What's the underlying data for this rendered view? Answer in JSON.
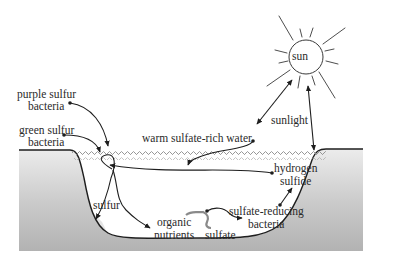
{
  "diagram": {
    "type": "ecosystem-cycle",
    "colors": {
      "line": "#1e1e1e",
      "ground_light": "#e9e9e9",
      "ground_dark": "#b4b4b4",
      "water_waves": "#8c8c8c",
      "background": "#ffffff"
    },
    "labels": {
      "sun": "sun",
      "sunlight": "sunlight",
      "warm_water": "warm sulfate-rich water",
      "purple_sulfur_line1": "purple sulfur",
      "purple_sulfur_line2": "bacteria",
      "green_sulfur_line1": "green sulfur",
      "green_sulfur_line2": "bacteria",
      "hydrogen_sulfide_line1": "hydrogen",
      "hydrogen_sulfide_line2": "sulfide",
      "sulfur": "sulfur",
      "organic_nutrients_line1": "organic",
      "organic_nutrients_line2": "nutrients",
      "sulfate": "sulfate",
      "sulfate_reducing_line1": "sulfate-reducing",
      "sulfate_reducing_line2": "bacteria"
    },
    "nodes": [
      {
        "id": "sun",
        "label": "sun"
      },
      {
        "id": "sunlight",
        "label": "sunlight"
      },
      {
        "id": "warm_water",
        "label": "warm sulfate-rich water"
      },
      {
        "id": "purple_sulfur_bacteria",
        "label": "purple sulfur bacteria"
      },
      {
        "id": "green_sulfur_bacteria",
        "label": "green sulfur bacteria"
      },
      {
        "id": "hydrogen_sulfide",
        "label": "hydrogen sulfide"
      },
      {
        "id": "sulfur",
        "label": "sulfur"
      },
      {
        "id": "organic_nutrients",
        "label": "organic nutrients"
      },
      {
        "id": "sulfate",
        "label": "sulfate"
      },
      {
        "id": "sulfate_reducing_bacteria",
        "label": "sulfate-reducing bacteria"
      }
    ],
    "edges": [
      {
        "from": "sun",
        "to": "warm_water",
        "label": "sunlight"
      },
      {
        "from": "sun",
        "to": "water_surface",
        "label": "sunlight"
      },
      {
        "from": "purple_sulfur_bacteria",
        "to": "water_surface"
      },
      {
        "from": "green_sulfur_bacteria",
        "to": "water_surface"
      },
      {
        "from": "warm_water",
        "to": "pond_interior"
      },
      {
        "from": "hydrogen_sulfide",
        "to": "sulfur_bacteria_loop"
      },
      {
        "from": "sulfur_bacteria_loop",
        "to": "sulfur"
      },
      {
        "from": "sulfur_bacteria_loop",
        "to": "organic_nutrients"
      },
      {
        "from": "sulfate",
        "to": "sulfate_reducing_bacteria"
      },
      {
        "from": "sulfate_reducing_bacteria",
        "to": "hydrogen_sulfide"
      }
    ]
  }
}
